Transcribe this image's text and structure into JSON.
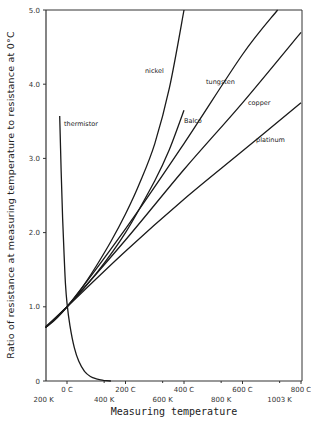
{
  "chart_data": {
    "type": "line",
    "title": "",
    "xlabel": "Measuring temperature",
    "ylabel": "Ratio of resistance at measuring temperature to resistance at 0°C",
    "xlim_celsius": [
      -73,
      800
    ],
    "ylim": [
      0,
      5.0
    ],
    "grid": false,
    "legend": "inline labels",
    "y_ticks": [
      {
        "value": 0,
        "label": "0"
      },
      {
        "value": 1.0,
        "label": "1.0"
      },
      {
        "value": 2.0,
        "label": "2.0"
      },
      {
        "value": 3.0,
        "label": "3.0"
      },
      {
        "value": 4.0,
        "label": "4.0"
      },
      {
        "value": 5.0,
        "label": "5.0"
      }
    ],
    "x_ticks_celsius": [
      {
        "value": 0,
        "label": "0  C"
      },
      {
        "value": 200,
        "label": "200  C"
      },
      {
        "value": 400,
        "label": "400  C"
      },
      {
        "value": 600,
        "label": "600  C"
      },
      {
        "value": 800,
        "label": "800  C"
      }
    ],
    "x_ticks_kelvin": [
      {
        "value_celsius": -73,
        "label": "200 K"
      },
      {
        "value_celsius": 127,
        "label": "400 K"
      },
      {
        "value_celsius": 327,
        "label": "600 K"
      },
      {
        "value_celsius": 527,
        "label": "800 K"
      },
      {
        "value_celsius": 727,
        "label": "1003 K"
      }
    ],
    "x_unit": "°C",
    "series": [
      {
        "name": "nickel",
        "label_pos": [
          145,
          73
        ],
        "points": [
          [
            -73,
            0.72
          ],
          [
            0,
            1.0
          ],
          [
            50,
            1.25
          ],
          [
            100,
            1.55
          ],
          [
            150,
            1.88
          ],
          [
            200,
            2.25
          ],
          [
            250,
            2.68
          ],
          [
            300,
            3.2
          ],
          [
            350,
            3.95
          ],
          [
            400,
            5.0
          ]
        ]
      },
      {
        "name": "Balco",
        "label_pos": [
          184,
          123
        ],
        "points": [
          [
            -73,
            0.73
          ],
          [
            0,
            1.0
          ],
          [
            100,
            1.45
          ],
          [
            200,
            2.0
          ],
          [
            300,
            2.7
          ],
          [
            350,
            3.12
          ],
          [
            400,
            3.65
          ]
        ]
      },
      {
        "name": "tungsten",
        "label_pos": [
          206,
          84
        ],
        "points": [
          [
            -73,
            0.72
          ],
          [
            0,
            1.0
          ],
          [
            200,
            2.05
          ],
          [
            400,
            3.2
          ],
          [
            600,
            4.4
          ],
          [
            720,
            5.0
          ]
        ]
      },
      {
        "name": "copper",
        "label_pos": [
          248,
          105
        ],
        "points": [
          [
            -73,
            0.72
          ],
          [
            0,
            1.0
          ],
          [
            200,
            1.9
          ],
          [
            400,
            2.85
          ],
          [
            600,
            3.75
          ],
          [
            800,
            4.7
          ]
        ]
      },
      {
        "name": "platinum",
        "label_pos": [
          256,
          142
        ],
        "points": [
          [
            -73,
            0.72
          ],
          [
            0,
            1.0
          ],
          [
            200,
            1.75
          ],
          [
            400,
            2.45
          ],
          [
            600,
            3.1
          ],
          [
            800,
            3.75
          ]
        ]
      },
      {
        "name": "thermistor",
        "label_pos": [
          64,
          126
        ],
        "points": [
          [
            -25,
            3.57
          ],
          [
            -20,
            2.85
          ],
          [
            -15,
            2.2
          ],
          [
            -10,
            1.7
          ],
          [
            -5,
            1.3
          ],
          [
            0,
            1.05
          ],
          [
            10,
            0.75
          ],
          [
            25,
            0.45
          ],
          [
            40,
            0.27
          ],
          [
            60,
            0.13
          ],
          [
            80,
            0.06
          ],
          [
            100,
            0.03
          ],
          [
            125,
            0.01
          ],
          [
            150,
            0.0
          ]
        ]
      }
    ]
  }
}
